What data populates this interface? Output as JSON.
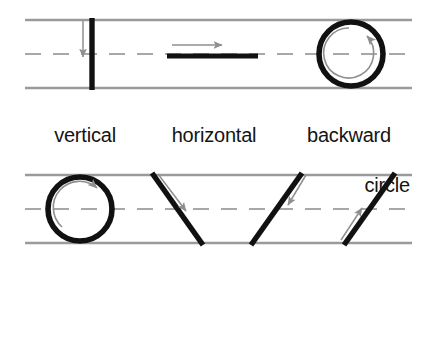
{
  "figure": {
    "background_color": "#ffffff",
    "guide_line_color": "#9a9a9a",
    "midline_color": "#a8a8a8",
    "stroke_color": "#111111",
    "arrow_color": "#8f8f8f",
    "guide_left_x": 25,
    "guide_right_x": 412
  },
  "panels": [
    {
      "id": "panel-top",
      "top_line_y": 20,
      "mid_line_y": 54,
      "bottom_line_y": 88,
      "items": [
        {
          "id": "vertical",
          "label_lines": [
            "vertical"
          ],
          "stroke_type": "vertical-line",
          "arrow_direction": "down",
          "arrow_label": "down-arrow"
        },
        {
          "id": "horizontal",
          "label_lines": [
            "horizontal"
          ],
          "stroke_type": "horizontal-line",
          "arrow_direction": "right",
          "arrow_label": "right-arrow"
        },
        {
          "id": "backward-circle",
          "label_lines": [
            "backward",
            "circle"
          ],
          "stroke_type": "circle",
          "arrow_direction": "counter-clockwise",
          "arrow_label": "counter-clockwise-arrow"
        }
      ]
    },
    {
      "id": "panel-bottom",
      "top_line_y": 175,
      "mid_line_y": 209,
      "bottom_line_y": 243,
      "items": [
        {
          "id": "forward-circle",
          "label_lines": [
            "forward",
            "circle"
          ],
          "stroke_type": "circle",
          "arrow_direction": "clockwise",
          "arrow_label": "clockwise-arrow"
        },
        {
          "id": "slant-right",
          "label_lines": [
            "slant",
            "right"
          ],
          "stroke_type": "diagonal-down-right",
          "arrow_direction": "down-right",
          "arrow_label": "down-right-arrow"
        },
        {
          "id": "slant-left",
          "label_lines": [
            "slant",
            "left"
          ],
          "stroke_type": "diagonal-up-right",
          "arrow_direction": "down-left",
          "arrow_label": "down-left-arrow"
        },
        {
          "id": "slant-up",
          "label_lines": [
            "slant",
            "up"
          ],
          "stroke_type": "diagonal-up-right",
          "arrow_direction": "up-right",
          "arrow_label": "up-right-arrow"
        }
      ]
    }
  ],
  "labels": {
    "vertical": "vertical",
    "horizontal": "horizontal",
    "backward_line1": "backward",
    "backward_line2": "circle",
    "forward_line1": "forward",
    "forward_line2": "circle",
    "slant_right_line1": "slant",
    "slant_right_line2": "right",
    "slant_left_line1": "slant",
    "slant_left_line2": "left",
    "slant_up_line1": "slant",
    "slant_up_line2": "up"
  }
}
